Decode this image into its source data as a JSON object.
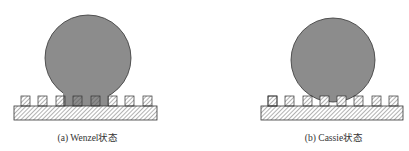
{
  "figure": {
    "panels": [
      {
        "id": "a",
        "caption": "(a) Wenzel状态",
        "state": "Wenzel",
        "description": "Droplet penetrates gaps between pillars"
      },
      {
        "id": "b",
        "caption": "(b) Cassie状态",
        "state": "Cassie",
        "description": "Droplet rests on top of pillars"
      }
    ],
    "colors": {
      "droplet_fill": "#8c8c8c",
      "outline": "#333333",
      "hatch": "#555555",
      "background": "#ffffff"
    },
    "pillar_count": 8
  }
}
